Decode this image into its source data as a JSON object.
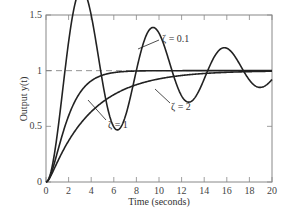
{
  "chart_data": {
    "type": "line",
    "title": "",
    "xlabel": "Time (seconds)",
    "ylabel": "Output y(t)",
    "xlim": [
      0,
      20
    ],
    "ylim": [
      0,
      1.5
    ],
    "xticks": [
      "0",
      "2",
      "4",
      "6",
      "8",
      "10",
      "12",
      "14",
      "16",
      "18",
      "20"
    ],
    "yticks": [
      "0",
      "0.5",
      "1",
      "1.5"
    ],
    "reference_line": {
      "y": 1,
      "style": "dashed"
    },
    "grid": false,
    "series": [
      {
        "name": "ζ = 0.1",
        "zeta": 0.1
      },
      {
        "name": "ζ = 1",
        "zeta": 1
      },
      {
        "name": "ζ = 2",
        "zeta": 2
      }
    ],
    "annotations": [
      "ζ = 0.1",
      "ζ = 1",
      "ζ = 2"
    ]
  }
}
